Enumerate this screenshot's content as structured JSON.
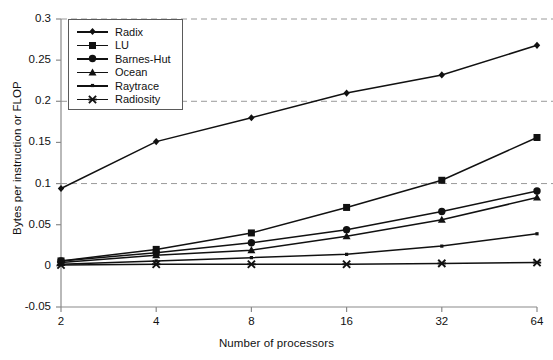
{
  "chart_data": {
    "type": "line",
    "title": "",
    "xlabel": "Number of processors",
    "ylabel": "Bytes per instruction or FLOP",
    "x": [
      2,
      4,
      8,
      16,
      32,
      64
    ],
    "categories": [
      "2",
      "4",
      "8",
      "16",
      "32",
      "64"
    ],
    "xscale": "categorical (log2 processors)",
    "ylim": [
      -0.05,
      0.3
    ],
    "yticks": [
      -0.05,
      0,
      0.05,
      0.1,
      0.15,
      0.2,
      0.25,
      0.3
    ],
    "ytick_labels": [
      "-0.05",
      "0",
      "0.05",
      "0.1",
      "0.15",
      "0.2",
      "0.25",
      "0.3"
    ],
    "grid": "horizontal dashed gridlines at 0.1, 0.2, 0.3",
    "gridlines": [
      0.1,
      0.2,
      0.3
    ],
    "legend_position": "top-left inside axes",
    "series": [
      {
        "name": "Radix",
        "marker": "diamond",
        "color": "#111111",
        "values": [
          0.094,
          0.151,
          0.18,
          0.21,
          0.232,
          0.268
        ]
      },
      {
        "name": "LU",
        "marker": "square",
        "color": "#111111",
        "values": [
          0.006,
          0.02,
          0.04,
          0.071,
          0.104,
          0.156
        ]
      },
      {
        "name": "Barnes-Hut",
        "marker": "circle",
        "color": "#111111",
        "values": [
          0.006,
          0.016,
          0.028,
          0.044,
          0.066,
          0.091
        ]
      },
      {
        "name": "Ocean",
        "marker": "triangle",
        "color": "#111111",
        "values": [
          0.004,
          0.013,
          0.019,
          0.036,
          0.056,
          0.083
        ]
      },
      {
        "name": "Raytrace",
        "marker": "dot",
        "color": "#111111",
        "values": [
          0.002,
          0.006,
          0.01,
          0.014,
          0.024,
          0.039
        ]
      },
      {
        "name": "Radiosity",
        "marker": "cross",
        "color": "#111111",
        "values": [
          0.001,
          0.002,
          0.002,
          0.002,
          0.003,
          0.004
        ]
      }
    ]
  },
  "axes": {
    "y_title": "Bytes per instruction or FLOP",
    "x_title": "Number of processors",
    "y_ticks": [
      "0.3",
      "0.25",
      "0.2",
      "0.15",
      "0.1",
      "0.05",
      "0",
      "-0.05"
    ],
    "x_ticks": [
      "2",
      "4",
      "8",
      "16",
      "32",
      "64"
    ]
  },
  "legend": {
    "items": [
      {
        "label": "Radix"
      },
      {
        "label": "LU"
      },
      {
        "label": "Barnes-Hut"
      },
      {
        "label": "Ocean"
      },
      {
        "label": "Raytrace"
      },
      {
        "label": "Radiosity"
      }
    ]
  },
  "style": {
    "axis_color": "#8a8a8a",
    "series_color": "#111111",
    "grid_color": "#9a9a9a",
    "background": "#ffffff"
  }
}
